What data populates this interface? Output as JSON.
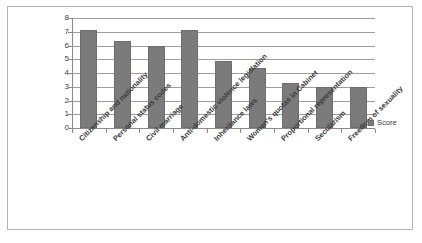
{
  "chart_data": {
    "type": "bar",
    "title": "",
    "xlabel": "",
    "ylabel": "",
    "ylim": [
      0,
      8
    ],
    "ytick_labels": [
      "8",
      "7",
      "6",
      "5",
      "4",
      "3",
      "2",
      "1",
      "0"
    ],
    "yticks": [
      8,
      7,
      6,
      5,
      4,
      3,
      2,
      1,
      0
    ],
    "grid": true,
    "legend_position": "right",
    "categories": [
      "Citizenship and nationality",
      "Personal status codes",
      "Civil marriage",
      "Anti-domestic violence legislation",
      "Inheritance laws",
      "Women's quotas in Cabinet",
      "Proportional representation",
      "Secularism",
      "Freedom of sexuality"
    ],
    "series": [
      {
        "name": "Score",
        "values": [
          7.15,
          6.3,
          6.0,
          7.15,
          4.85,
          4.35,
          3.3,
          3.0,
          3.0
        ]
      }
    ],
    "colors": {
      "bar_fill": "#7b7b7b",
      "bar_border": "#6e6e6e",
      "gridline": "#9e9e9e",
      "axis": "#8a8a8a",
      "frame_border": "#b4b4b4",
      "text": "#3d3d3d",
      "background": "#ffffff"
    }
  },
  "legend": {
    "entries": [
      {
        "label": "Score",
        "marker": "square-marker"
      }
    ]
  }
}
